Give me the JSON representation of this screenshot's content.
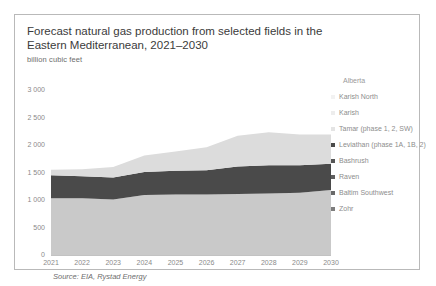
{
  "title": "Forecast natural gas production from selected fields in the Eastern Mediterranean, 2021–2030",
  "subtitle": "billion cubic feet",
  "source": "Source: EIA, Rystad Energy",
  "legend": {
    "title": "Alberta",
    "items": [
      {
        "label": "Karish North",
        "color": "#f2f2f2"
      },
      {
        "label": "Karish",
        "color": "#ededed"
      },
      {
        "label": "Tamar (phase 1, 2, SW)",
        "color": "#e4e4e4"
      },
      {
        "label": "Leviathan (phase 1A, 1B, 2)",
        "color": "#4a4a4a"
      },
      {
        "label": "Bashrush",
        "color": "#565656"
      },
      {
        "label": "Raven",
        "color": "#5e5e5e"
      },
      {
        "label": "Baltim Southwest",
        "color": "#696969"
      },
      {
        "label": "Zohr",
        "color": "#7d7d7d"
      }
    ]
  },
  "chart_data": {
    "type": "area",
    "title": "Forecast natural gas production from selected fields in the Eastern Mediterranean, 2021–2030",
    "xlabel": "",
    "ylabel": "billion cubic feet",
    "ylim": [
      0,
      3000
    ],
    "yticks": [
      "0",
      "500",
      "1 000",
      "1 500",
      "2 000",
      "2 500",
      "3 000"
    ],
    "ytickvals": [
      0,
      500,
      1000,
      1500,
      2000,
      2500,
      3000
    ],
    "grid": false,
    "legend_position": "right",
    "stacked": true,
    "categories": [
      2021,
      2022,
      2023,
      2024,
      2025,
      2026,
      2027,
      2028,
      2029,
      2030
    ],
    "series": [
      {
        "name": "Zohr",
        "color": "#c9c9c9",
        "values": [
          1030,
          1030,
          1010,
          1090,
          1100,
          1100,
          1110,
          1120,
          1130,
          1180
        ]
      },
      {
        "name": "Leviathan (phase 1A, 1B, 2)",
        "color": "#4a4a4a",
        "values": [
          420,
          400,
          400,
          420,
          430,
          440,
          500,
          510,
          500,
          480
        ]
      },
      {
        "name": "Tamar, Karish, Karish North and others",
        "color": "#dcdcdc",
        "values": [
          100,
          130,
          190,
          300,
          350,
          420,
          560,
          600,
          560,
          530
        ]
      }
    ],
    "totals": [
      1550,
      1560,
      1600,
      1810,
      1880,
      1960,
      2170,
      2230,
      2190,
      2190
    ]
  },
  "xticks": [
    "2021",
    "2022",
    "2023",
    "2024",
    "2025",
    "2026",
    "2027",
    "2028",
    "2029",
    "2030"
  ]
}
